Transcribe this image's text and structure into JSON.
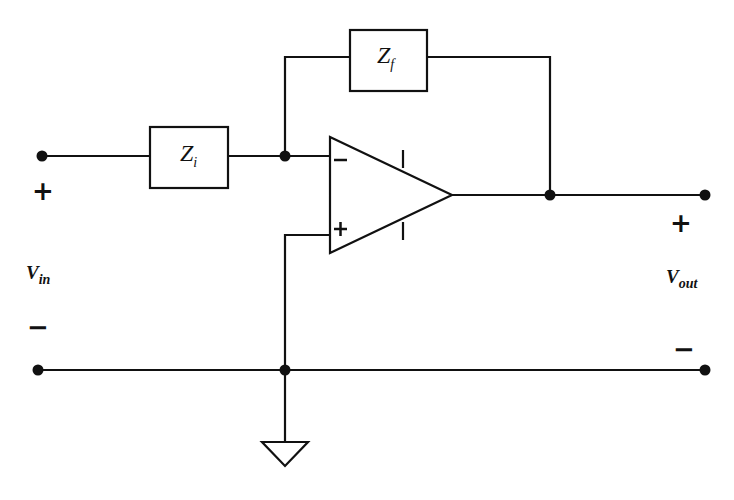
{
  "diagram": {
    "components": {
      "input_impedance": {
        "symbol": "Z",
        "subscript": "i"
      },
      "feedback_impedance": {
        "symbol": "Z",
        "subscript": "f"
      },
      "opamp": {
        "inverting_input": "−",
        "noninverting_input": "+"
      },
      "ground": "ground-symbol"
    },
    "input": {
      "label": "V",
      "subscript": "in",
      "plus": "+",
      "minus": "−"
    },
    "output": {
      "label": "V",
      "subscript": "out",
      "plus": "+",
      "minus": "−"
    },
    "colors": {
      "stroke": "#111111",
      "background": "#ffffff"
    }
  }
}
